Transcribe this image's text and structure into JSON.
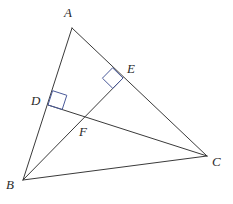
{
  "figure": {
    "type": "euclidean-geometry-diagram",
    "background_color": "#ffffff",
    "line_color": "#3a3a3a",
    "right_angle_color": "#4a5a9a",
    "label_color": "#2b2b2b",
    "canvas": {
      "width": 233,
      "height": 204
    }
  },
  "points": {
    "A": {
      "label": "A",
      "x": 72,
      "y": 28
    },
    "B": {
      "label": "B",
      "x": 23,
      "y": 180
    },
    "C": {
      "label": "C",
      "x": 207,
      "y": 156
    },
    "D": {
      "label": "D",
      "x": 48,
      "y": 105
    },
    "E": {
      "label": "E",
      "x": 123,
      "y": 78
    },
    "F": {
      "label": "F",
      "x": 87,
      "y": 118
    }
  },
  "segments": [
    {
      "name": "AB",
      "from": "A",
      "to": "B",
      "d": "M 72 28 L 23 180"
    },
    {
      "name": "AC",
      "from": "A",
      "to": "C",
      "d": "M 72 28 L 207 156"
    },
    {
      "name": "BC",
      "from": "B",
      "to": "C",
      "d": "M 23 180 L 207 156"
    },
    {
      "name": "DC",
      "from": "D",
      "to": "C",
      "d": "M 48 105 L 207 156"
    },
    {
      "name": "BE",
      "from": "B",
      "to": "E",
      "d": "M 23 180 L 123 78"
    }
  ],
  "right_angles": [
    {
      "name": "right-angle-at-D",
      "at": "D",
      "d": "M 52.6 90.7 L 66.8 95.3 L 62.2 109.5 L 48 105 Z"
    },
    {
      "name": "right-angle-at-E",
      "at": "E",
      "d": "M 112.6 67.8 L 123 78 L 112.8 88.4 L 102.4 78.2 Z"
    }
  ]
}
